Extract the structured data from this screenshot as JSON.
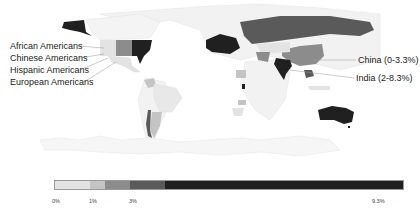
{
  "map": {
    "title": "",
    "annotations": {
      "left": [
        {
          "label": "African Americans"
        },
        {
          "label": "Chinese Americans"
        },
        {
          "label": "Hispanic Americans"
        },
        {
          "label": "European Americans"
        }
      ],
      "right": [
        {
          "label": "China (0-3.3%)"
        },
        {
          "label": "India (2-8.3%)"
        }
      ]
    },
    "colors": {
      "lightest": "#e3e3e3",
      "light": "#c4c4c4",
      "mid": "#8c8c8c",
      "dark": "#5a5a5a",
      "darkest": "#202020",
      "land_none": "#f4f4f4",
      "border": "#dcdcdc"
    }
  },
  "legend": {
    "segments": [
      {
        "from": 0,
        "to": 0.9,
        "color": "#e3e3e3"
      },
      {
        "from": 0.9,
        "to": 1.4,
        "color": "#c4c4c4"
      },
      {
        "from": 1.4,
        "to": 2.2,
        "color": "#8c8c8c"
      },
      {
        "from": 2.2,
        "to": 3.3,
        "color": "#5a5a5a"
      },
      {
        "from": 3.3,
        "to": 9.3,
        "color": "#202020"
      }
    ],
    "ticks": [
      "0%",
      "1%",
      "3%",
      "9.3%"
    ]
  }
}
